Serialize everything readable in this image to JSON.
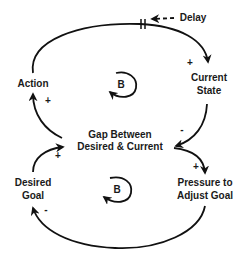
{
  "diagram": {
    "type": "causal-loop-diagram",
    "nodes": {
      "action": "Action",
      "current_state_line1": "Current",
      "current_state_line2": "State",
      "gap_line1": "Gap Between",
      "gap_line2": "Desired & Current",
      "desired_goal_line1": "Desired",
      "desired_goal_line2": "Goal",
      "pressure_line1": "Pressure to",
      "pressure_line2": "Adjust Goal"
    },
    "delay_label": "Delay",
    "loops": {
      "upper": "B",
      "lower": "B"
    },
    "polarities": {
      "action_to_current_state": "+",
      "current_state_to_gap": "-",
      "gap_to_action": "+",
      "gap_to_pressure": "+",
      "pressure_to_desired_goal": "-",
      "desired_goal_to_gap": "+"
    },
    "edges": [
      {
        "from": "Action",
        "to": "Current State",
        "polarity": "+",
        "delay": true
      },
      {
        "from": "Current State",
        "to": "Gap Between Desired & Current",
        "polarity": "-"
      },
      {
        "from": "Gap Between Desired & Current",
        "to": "Action",
        "polarity": "+"
      },
      {
        "from": "Gap Between Desired & Current",
        "to": "Pressure to Adjust Goal",
        "polarity": "+"
      },
      {
        "from": "Pressure to Adjust Goal",
        "to": "Desired Goal",
        "polarity": "-"
      },
      {
        "from": "Desired Goal",
        "to": "Gap Between Desired & Current",
        "polarity": "+"
      }
    ]
  }
}
